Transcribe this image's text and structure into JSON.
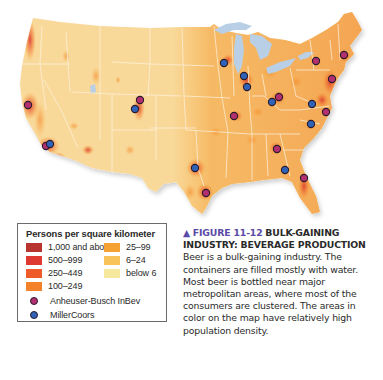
{
  "map": {
    "title": "Beverage production brewery locations over U.S. population density",
    "colors": {
      "land_base": "#f9d99a",
      "state_border": "#fdf3df",
      "lakes": "#b9cfe6",
      "anheuser_busch": "#b2306f",
      "millercoors": "#2f63b8",
      "dot_outline": "#2b1b2b"
    },
    "breweries": [
      {
        "company": "Anheuser-Busch InBev",
        "x": 28,
        "y": 105
      },
      {
        "company": "Anheuser-Busch InBev",
        "x": 46,
        "y": 146
      },
      {
        "company": "MillerCoors",
        "x": 50,
        "y": 144
      },
      {
        "company": "Anheuser-Busch InBev",
        "x": 140,
        "y": 100
      },
      {
        "company": "MillerCoors",
        "x": 135,
        "y": 109
      },
      {
        "company": "MillerCoors",
        "x": 195,
        "y": 168
      },
      {
        "company": "Anheuser-Busch InBev",
        "x": 206,
        "y": 193
      },
      {
        "company": "Anheuser-Busch InBev",
        "x": 234,
        "y": 116
      },
      {
        "company": "MillerCoors",
        "x": 224,
        "y": 63
      },
      {
        "company": "MillerCoors",
        "x": 244,
        "y": 76
      },
      {
        "company": "MillerCoors",
        "x": 247,
        "y": 87
      },
      {
        "company": "MillerCoors",
        "x": 272,
        "y": 102
      },
      {
        "company": "Anheuser-Busch InBev",
        "x": 279,
        "y": 97
      },
      {
        "company": "Anheuser-Busch InBev",
        "x": 316,
        "y": 61
      },
      {
        "company": "Anheuser-Busch InBev",
        "x": 344,
        "y": 55
      },
      {
        "company": "Anheuser-Busch InBev",
        "x": 332,
        "y": 79
      },
      {
        "company": "MillerCoors",
        "x": 312,
        "y": 104
      },
      {
        "company": "Anheuser-Busch InBev",
        "x": 326,
        "y": 112
      },
      {
        "company": "MillerCoors",
        "x": 311,
        "y": 124
      },
      {
        "company": "Anheuser-Busch InBev",
        "x": 277,
        "y": 149
      },
      {
        "company": "MillerCoors",
        "x": 285,
        "y": 170
      },
      {
        "company": "Anheuser-Busch InBev",
        "x": 304,
        "y": 178
      }
    ]
  },
  "legend": {
    "title": "Persons per square kilometer",
    "classes": [
      {
        "label": "1,000 and above",
        "color": "#b8342f"
      },
      {
        "label": "25–99",
        "color": "#f5a233"
      },
      {
        "label": "500–999",
        "color": "#de3a32"
      },
      {
        "label": "6–24",
        "color": "#f8c35a"
      },
      {
        "label": "250–449",
        "color": "#ef5a2a"
      },
      {
        "label": "below 6",
        "color": "#f6e89c"
      },
      {
        "label": "100–249",
        "color": "#f4822a"
      }
    ],
    "markers": [
      {
        "label": "Anheuser-Busch InBev",
        "color": "#b2306f"
      },
      {
        "label": "MillerCoors",
        "color": "#2f63b8"
      }
    ]
  },
  "caption": {
    "marker": "▲",
    "figure_number": "FIGURE 11-12",
    "headline": "BULK-GAINING INDUSTRY: BEVERAGE PRODUCTION",
    "body": "Beer is a bulk-gaining industry. The containers are filled mostly with water. Most beer is bottled near major metropolitan areas, where most of the consumers are clustered. The areas in color on the map have relatively high population density."
  }
}
